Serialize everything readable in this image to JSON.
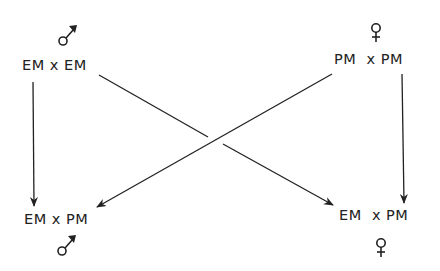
{
  "nodes": {
    "top_left": {
      "text": "EM x EM",
      "sex": "male"
    },
    "top_right": {
      "text": "PM  x PM",
      "sex": "female"
    },
    "bottom_left": {
      "text": "EM x PM",
      "sex": "male"
    },
    "bottom_right": {
      "text": "EM  x PM",
      "sex": "female"
    }
  },
  "edges": [
    {
      "from": "top_left",
      "to": "bottom_left"
    },
    {
      "from": "top_left",
      "to": "bottom_right"
    },
    {
      "from": "top_right",
      "to": "bottom_left"
    },
    {
      "from": "top_right",
      "to": "bottom_right"
    }
  ],
  "colors": {
    "ink": "#222222",
    "background": "#ffffff"
  }
}
